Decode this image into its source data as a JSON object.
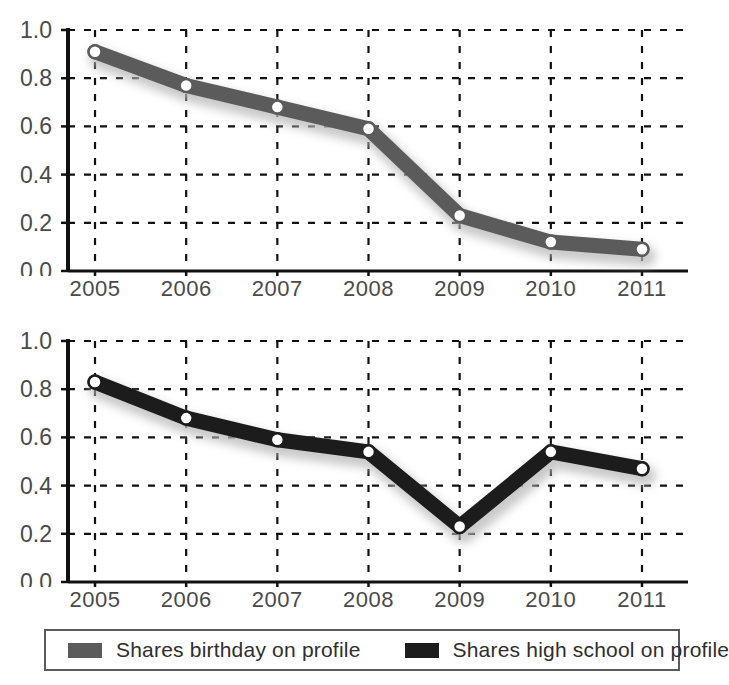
{
  "figure": {
    "cropped_header_text": "",
    "background_color": "#ffffff"
  },
  "legend": {
    "name": "chart-legend",
    "items": [
      {
        "label": "Shares birthday on profile",
        "color": "#5b5b5b"
      },
      {
        "label": "Shares high school on profile",
        "color": "#1c1c1c"
      }
    ]
  },
  "axes": {
    "y_ticks": [
      "0.0",
      "0.2",
      "0.4",
      "0.6",
      "0.8",
      "1.0"
    ],
    "x_ticks": [
      "2005",
      "2006",
      "2007",
      "2008",
      "2009",
      "2010",
      "2011"
    ]
  },
  "chart_data": [
    {
      "type": "line",
      "id": "chart-top",
      "title": "",
      "xlabel": "",
      "ylabel": "",
      "x": [
        2005,
        2006,
        2007,
        2008,
        2009,
        2010,
        2011
      ],
      "categories": [
        "2005",
        "2006",
        "2007",
        "2008",
        "2009",
        "2010",
        "2011"
      ],
      "series": [
        {
          "name": "Shares birthday on profile",
          "color": "#5b5b5b",
          "values": [
            0.91,
            0.77,
            0.68,
            0.59,
            0.23,
            0.12,
            0.09
          ]
        }
      ],
      "ylim": [
        0.0,
        1.0
      ],
      "ytick_step": 0.2,
      "grid": true,
      "grid_style": "dotted",
      "marker": "circle-white-fill",
      "legend_position": "below-figure"
    },
    {
      "type": "line",
      "id": "chart-bottom",
      "title": "",
      "xlabel": "",
      "ylabel": "",
      "x": [
        2005,
        2006,
        2007,
        2008,
        2009,
        2010,
        2011
      ],
      "categories": [
        "2005",
        "2006",
        "2007",
        "2008",
        "2009",
        "2010",
        "2011"
      ],
      "series": [
        {
          "name": "Shares high school on profile",
          "color": "#1c1c1c",
          "values": [
            0.83,
            0.68,
            0.59,
            0.54,
            0.23,
            0.54,
            0.47
          ]
        }
      ],
      "ylim": [
        0.0,
        1.0
      ],
      "ytick_step": 0.2,
      "grid": true,
      "grid_style": "dotted",
      "marker": "circle-white-fill",
      "legend_position": "below-figure"
    }
  ]
}
